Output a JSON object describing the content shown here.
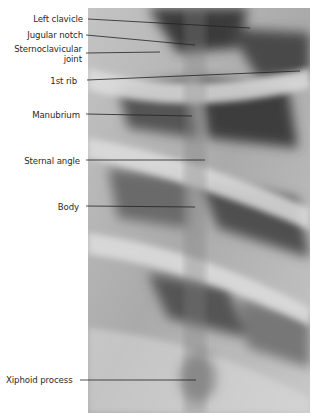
{
  "figure": {
    "labels": [
      {
        "id": "left-clavicle",
        "text": "Left clavicle"
      },
      {
        "id": "jugular-notch",
        "text": "Jugular notch"
      },
      {
        "id": "sternoclavicular-joint",
        "text": "Sternoclavicular",
        "text2": "joint"
      },
      {
        "id": "first-rib",
        "text": "1st rib"
      },
      {
        "id": "manubrium",
        "text": "Manubrium"
      },
      {
        "id": "sternal-angle",
        "text": "Sternal angle"
      },
      {
        "id": "body",
        "text": "Body"
      },
      {
        "id": "xiphoid-process",
        "text": "Xiphoid process"
      }
    ]
  }
}
